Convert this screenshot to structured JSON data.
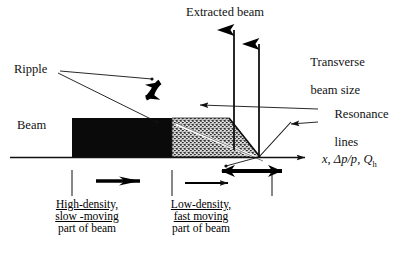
{
  "diagram": {
    "title_label": "Extracted beam",
    "labels": {
      "extracted_beam": "Extracted beam",
      "transverse_line1": "Transverse",
      "transverse_line2": "beam size",
      "resonance_line1": "Resonance",
      "resonance_line2": "lines",
      "ripple": "Ripple",
      "beam": "Beam"
    },
    "axis": {
      "var_x": "x",
      "sep1": ", ",
      "var_dp": "Δp/p",
      "sep2": ", ",
      "var_q": "Q",
      "q_subscript": "h"
    },
    "groups": [
      {
        "name": "high-density",
        "line1": "High-density,",
        "line2": "slow -moving",
        "line3": "part of beam"
      },
      {
        "name": "low-density",
        "line1": "Low-density,",
        "line2": "fast moving",
        "line3": "part of beam"
      }
    ],
    "colors": {
      "ink": "#000000",
      "background": "#ffffff",
      "stipple_fill": "#6d6d6d",
      "solid_fill": "#0a0a0a"
    },
    "shapes": {
      "solid_block_name": "high-density-beam-block",
      "stipple_triangle_name": "low-density-beam-triangle",
      "axis_name": "horizontal-axis",
      "ripple_arrow_name": "ripple-double-arrow",
      "extracted_arrow_name": "extracted-beam-arrow",
      "transverse_arrow_name": "transverse-beam-size-arrow",
      "separatrix_name": "resonance-separatrix-line",
      "spread_arrow_name": "momentum-spread-double-arrow"
    }
  }
}
